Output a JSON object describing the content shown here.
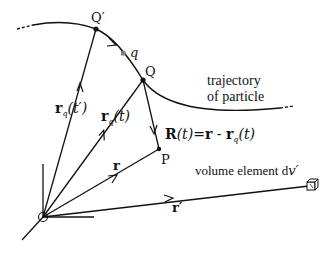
{
  "diagram": {
    "points": {
      "Q_prime": {
        "label": "Q′",
        "x": 96,
        "y": 29
      },
      "Q": {
        "label": "Q",
        "x": 143,
        "y": 80
      },
      "q": {
        "label": "q",
        "x": 123,
        "y": 53
      },
      "P": {
        "label": "P",
        "x": 159,
        "y": 149
      },
      "origin": {
        "x": 43,
        "y": 217
      }
    },
    "vectors": {
      "rq_tprime": {
        "bold": "r",
        "sub": "q",
        "arg": "(t′)"
      },
      "rq_t": {
        "bold": "r",
        "sub": "q",
        "arg": "(t)"
      },
      "r": {
        "bold": "r"
      },
      "r_prime": {
        "bold": "r′"
      },
      "R": {
        "bold": "R",
        "arg": "(t)",
        "eq": "=",
        "rhs_bold": "r",
        "minus": " - ",
        "rhs2_bold": "r",
        "rhs2_sub": "q",
        "rhs2_arg": "(t)"
      }
    },
    "labels": {
      "trajectory_line1": "trajectory",
      "trajectory_line2": "of particle",
      "volume_element": "volume element d",
      "volume_element_var": "v′"
    },
    "colors": {
      "ink": "#111111",
      "charge_dot": "#808080",
      "background": "#ffffff"
    }
  }
}
